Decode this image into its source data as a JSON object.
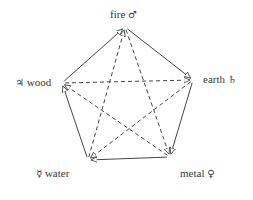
{
  "nodes": [
    {
      "id": "fire",
      "label": "fire",
      "symbol": "♂",
      "x": 125,
      "y": 27
    },
    {
      "id": "earth",
      "label": "earth",
      "symbol": "♄",
      "x": 193,
      "y": 80
    },
    {
      "id": "metal",
      "label": "metal",
      "symbol": "♀",
      "x": 170,
      "y": 157
    },
    {
      "id": "water",
      "label": "water",
      "symbol": "☿",
      "x": 88,
      "y": 160
    },
    {
      "id": "wood",
      "label": "wood",
      "symbol": "♃",
      "x": 62,
      "y": 83
    }
  ],
  "edges": {
    "solid": [
      [
        "wood",
        "fire"
      ],
      [
        "fire",
        "earth"
      ],
      [
        "earth",
        "metal"
      ],
      [
        "metal",
        "water"
      ],
      [
        "water",
        "wood"
      ]
    ],
    "dashed": [
      [
        "wood",
        "earth"
      ],
      [
        "earth",
        "water"
      ],
      [
        "water",
        "fire"
      ],
      [
        "fire",
        "metal"
      ],
      [
        "metal",
        "wood"
      ]
    ]
  },
  "colors": {
    "line": "#444444",
    "text": "#3a3a3a"
  }
}
